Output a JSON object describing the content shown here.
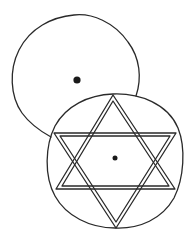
{
  "diagram": {
    "colors": {
      "background": "#ffffff",
      "ink": "#2a2a2a",
      "dot": "#1a1a1a"
    },
    "upper_circle": {
      "cx": 77,
      "cy": 78,
      "r": 65,
      "center_dot": {
        "x": 77,
        "y": 80,
        "r": 3.6
      }
    },
    "lower_circle": {
      "cx": 115,
      "cy": 161,
      "r": 67,
      "center_dot": {
        "x": 115,
        "y": 158,
        "r": 2.5
      }
    },
    "hexagram": {
      "triangle_up": [
        [
          113,
          95
        ],
        [
          175,
          189
        ],
        [
          56,
          189
        ]
      ],
      "triangle_down": [
        [
          54,
          133
        ],
        [
          176,
          133
        ],
        [
          116,
          228
        ]
      ],
      "line_style": "double"
    }
  }
}
